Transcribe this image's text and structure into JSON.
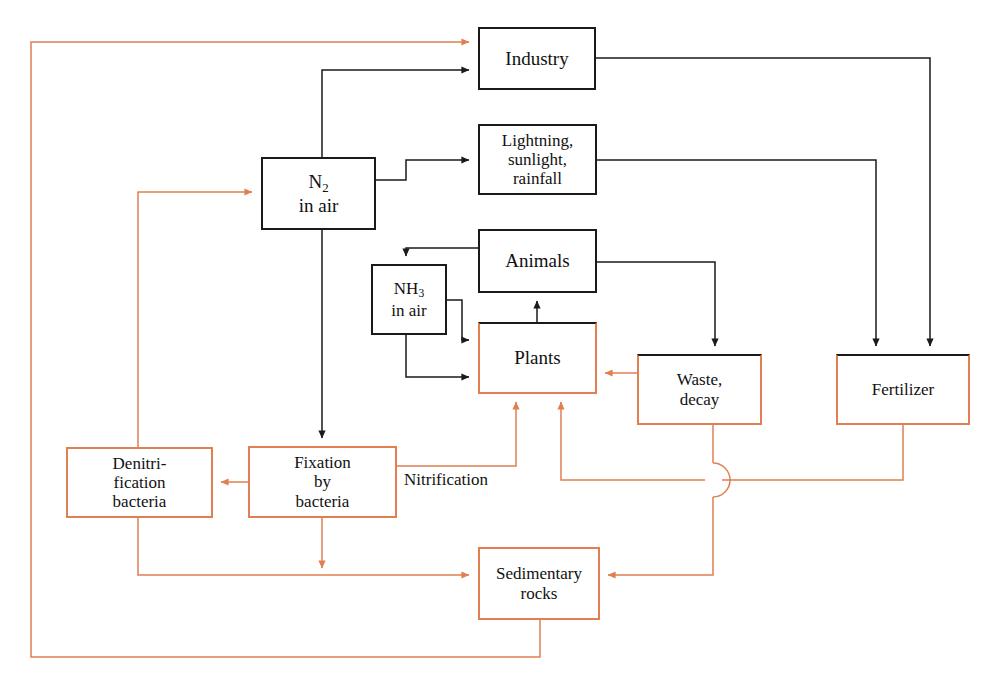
{
  "diagram": {
    "colors": {
      "black": "#1a1a1a",
      "orange": "#e08050",
      "background": "#ffffff"
    },
    "nodes": [
      {
        "id": "industry",
        "label": "Industry",
        "x": 478,
        "y": 27,
        "w": 118,
        "h": 63,
        "border": "black",
        "font": 19
      },
      {
        "id": "lightning",
        "label": "Lightning,\nsunlight,\nrainfall",
        "x": 478,
        "y": 124,
        "w": 119,
        "h": 71,
        "border": "black",
        "font": 17
      },
      {
        "id": "n2",
        "label": "N<sub>2</sub>\nin air",
        "x": 261,
        "y": 157,
        "w": 115,
        "h": 73,
        "border": "black",
        "font": 19,
        "html": true
      },
      {
        "id": "animals",
        "label": "Animals",
        "x": 478,
        "y": 229,
        "w": 119,
        "h": 64,
        "border": "black",
        "font": 19
      },
      {
        "id": "nh3",
        "label": "NH<sub>3</sub>\nin air",
        "x": 371,
        "y": 264,
        "w": 76,
        "h": 71,
        "border": "black",
        "font": 17,
        "html": true
      },
      {
        "id": "plants",
        "label": "Plants",
        "x": 478,
        "y": 322,
        "w": 119,
        "h": 72,
        "border": "mixed",
        "font": 19
      },
      {
        "id": "waste",
        "label": "Waste,\ndecay",
        "x": 637,
        "y": 354,
        "w": 125,
        "h": 71,
        "border": "mixed",
        "font": 17
      },
      {
        "id": "fertilizer",
        "label": "Fertilizer",
        "x": 836,
        "y": 354,
        "w": 134,
        "h": 71,
        "border": "mixed",
        "font": 17
      },
      {
        "id": "denitrification",
        "label": "Denitri-\nfication\nbacteria",
        "x": 66,
        "y": 447,
        "w": 147,
        "h": 71,
        "border": "orange",
        "font": 17
      },
      {
        "id": "fixation",
        "label": "Fixation\nby\nbacteria",
        "x": 248,
        "y": 446,
        "w": 149,
        "h": 72,
        "border": "orange",
        "font": 17
      },
      {
        "id": "sedimentary",
        "label": "Sedimentary\nrocks",
        "x": 478,
        "y": 547,
        "w": 122,
        "h": 73,
        "border": "orange",
        "font": 17
      }
    ],
    "edge_labels": [
      {
        "id": "nitrification",
        "text": "Nitrification",
        "x": 404,
        "y": 481,
        "font": 17
      }
    ],
    "flows": [
      {
        "from": "sedimentary-loop",
        "to": "industry",
        "color": "orange"
      },
      {
        "from": "n2",
        "to": "industry",
        "color": "black"
      },
      {
        "from": "n2",
        "to": "lightning",
        "color": "black"
      },
      {
        "from": "denitrification",
        "to": "n2",
        "color": "orange"
      },
      {
        "from": "n2",
        "to": "fixation",
        "color": "black"
      },
      {
        "from": "industry",
        "to": "fertilizer",
        "color": "black"
      },
      {
        "from": "lightning",
        "to": "fertilizer",
        "color": "black"
      },
      {
        "from": "animals",
        "to": "nh3",
        "color": "black"
      },
      {
        "from": "animals",
        "to": "waste",
        "color": "black"
      },
      {
        "from": "plants",
        "to": "animals",
        "color": "black"
      },
      {
        "from": "nh3",
        "to": "plants",
        "color": "black"
      },
      {
        "from": "waste",
        "to": "plants",
        "color": "orange"
      },
      {
        "from": "fixation",
        "to": "denitrification",
        "color": "orange"
      },
      {
        "from": "fixation",
        "to": "plants",
        "color": "orange"
      },
      {
        "from": "fixation",
        "to": "sedimentary",
        "color": "orange"
      },
      {
        "from": "denitrification",
        "to": "sedimentary",
        "color": "orange"
      },
      {
        "from": "fertilizer",
        "to": "plants",
        "color": "orange"
      },
      {
        "from": "waste",
        "to": "sedimentary",
        "color": "orange"
      }
    ]
  }
}
